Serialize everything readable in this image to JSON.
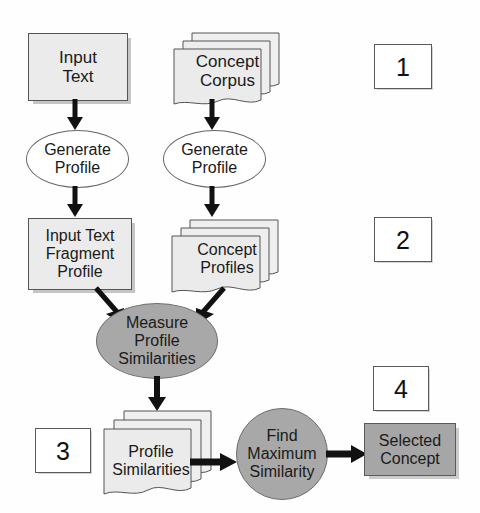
{
  "diagram": {
    "colors": {
      "light_fill": "#ebebeb",
      "mid_gray_fill": "#a8a8a8",
      "dark_fill": "#a6a6a6",
      "stroke": "#555555",
      "text": "#1a1a1a",
      "arrow": "#111111",
      "background": "#ffffff"
    },
    "steps": [
      {
        "id": "step-1",
        "label": "1"
      },
      {
        "id": "step-2",
        "label": "2"
      },
      {
        "id": "step-3",
        "label": "3"
      },
      {
        "id": "step-4",
        "label": "4"
      }
    ],
    "nodes": {
      "input_text": {
        "label": "Input\nText",
        "shape": "rectangle",
        "fill": "light"
      },
      "concept_corpus": {
        "label": "Concept\nCorpus",
        "shape": "document-stack",
        "fill": "light",
        "copies": 3
      },
      "generate_profile_left": {
        "label": "Generate\nProfile",
        "shape": "ellipse",
        "fill": "white"
      },
      "generate_profile_right": {
        "label": "Generate\nProfile",
        "shape": "ellipse",
        "fill": "white"
      },
      "input_text_fragment_profile": {
        "label": "Input Text\nFragment\nProfile",
        "shape": "rectangle",
        "fill": "light"
      },
      "concept_profiles": {
        "label": "Concept\nProfiles",
        "shape": "document-stack",
        "fill": "light",
        "copies": 3
      },
      "measure_profile_similarities": {
        "label": "Measure\nProfile\nSimilarities",
        "shape": "ellipse",
        "fill": "mid-gray"
      },
      "profile_similarities": {
        "label": "Profile\nSimilarities",
        "shape": "document-stack",
        "fill": "light",
        "copies": 3
      },
      "find_maximum_similarity": {
        "label": "Find\nMaximum\nSimilarity",
        "shape": "circle",
        "fill": "mid-gray"
      },
      "selected_concept": {
        "label": "Selected\nConcept",
        "shape": "rectangle",
        "fill": "dark"
      }
    },
    "edges": [
      {
        "from": "input_text",
        "to": "generate_profile_left",
        "direction": "down"
      },
      {
        "from": "concept_corpus",
        "to": "generate_profile_right",
        "direction": "down"
      },
      {
        "from": "generate_profile_left",
        "to": "input_text_fragment_profile",
        "direction": "down"
      },
      {
        "from": "generate_profile_right",
        "to": "concept_profiles",
        "direction": "down"
      },
      {
        "from": "input_text_fragment_profile",
        "to": "measure_profile_similarities",
        "direction": "down-right"
      },
      {
        "from": "concept_profiles",
        "to": "measure_profile_similarities",
        "direction": "down-left"
      },
      {
        "from": "measure_profile_similarities",
        "to": "profile_similarities",
        "direction": "down"
      },
      {
        "from": "profile_similarities",
        "to": "find_maximum_similarity",
        "direction": "right"
      },
      {
        "from": "find_maximum_similarity",
        "to": "selected_concept",
        "direction": "right"
      }
    ]
  }
}
